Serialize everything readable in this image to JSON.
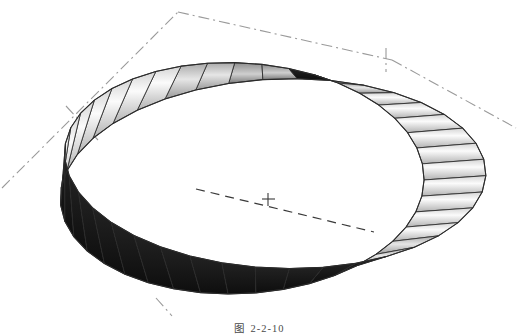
{
  "figure": {
    "caption_label": "图",
    "caption_number": "2-2-10",
    "caption_full": "图 2-2-10",
    "background_color": "#ffffff"
  },
  "colors": {
    "surface_light": "#f2f2f2",
    "surface_mid": "#b9b9b9",
    "surface_dark": "#8a8a8a",
    "surface_shadow": "#1a1a1a",
    "edge_line": "#2b2b2b",
    "construction_line": "#9a9a9a",
    "center_line": "#3a3a3a",
    "caption_text": "#4a4a4a"
  },
  "geometry": {
    "center_x": 259,
    "center_y": 176,
    "radius_x": 196,
    "radius_y": 104,
    "band_width": 62,
    "tilt_degrees": -8,
    "facet_count": 40,
    "half_twists": 1,
    "projection": "isometric"
  },
  "construction": {
    "dashdot_style": "dash-dot",
    "center_mark": "+",
    "center_mark_x": 268,
    "center_mark_y": 199,
    "axes": [
      {
        "name": "axis-upper-left",
        "x1": 2,
        "y1": 188,
        "x2": 178,
        "y2": 12
      },
      {
        "name": "axis-upper-right",
        "x1": 178,
        "y1": 12,
        "x2": 392,
        "y2": 60
      },
      {
        "name": "axis-right",
        "x1": 392,
        "y1": 60,
        "x2": 516,
        "y2": 128
      },
      {
        "name": "axis-left-stub",
        "x1": 66,
        "y1": 108,
        "x2": 96,
        "y2": 138
      },
      {
        "name": "axis-bottom-stub",
        "x1": 158,
        "y1": 300,
        "x2": 172,
        "y2": 314
      }
    ],
    "centerline": {
      "name": "ellipse-centerline",
      "style": "dashed",
      "x1": 196,
      "y1": 190,
      "x2": 372,
      "y2": 231
    }
  }
}
